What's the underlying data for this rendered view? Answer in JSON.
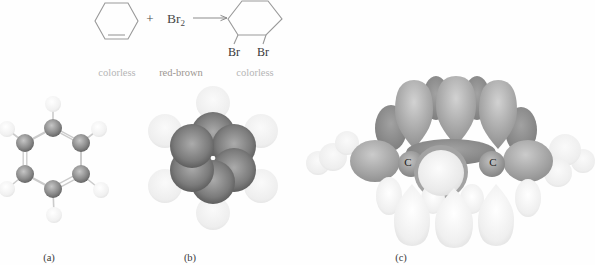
{
  "figure": {
    "reaction": {
      "plus": "+",
      "bromine": "Br",
      "bromine_sub": "2",
      "br_left": "Br",
      "br_right": "Br",
      "caption_reactant": "colorless",
      "caption_reagent": "red-brown",
      "caption_product": "colorless"
    },
    "panels": {
      "a": "(a)",
      "b": "(b)",
      "c": "(c)"
    },
    "orbital": {
      "carbon_left": "C",
      "carbon_right": "C"
    },
    "colors": {
      "line_art": "#999999",
      "formula_text": "#4a4a4a",
      "substituent_text": "#383838",
      "panel_label_text": "#3a3a3a",
      "caption_colorless": "#b5b5b5",
      "caption_red_brown": "#9c9691",
      "carbon_sphere": "#5a5a5a",
      "hydrogen_sphere": "#e8e8e8",
      "orbital_top_lobe": "#8e8e8e",
      "orbital_bottom_lobe": "#dedede"
    }
  }
}
